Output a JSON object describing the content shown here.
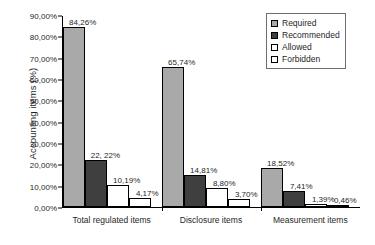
{
  "chart_data": {
    "type": "bar",
    "title": "",
    "xlabel": "",
    "ylabel": "Accounting items (%)",
    "ylim": [
      0,
      90
    ],
    "grid": false,
    "legend_position": "top-right",
    "categories": [
      "Total regulated items",
      "Disclosure items",
      "Measurement items"
    ],
    "ytick_labels": [
      "90,00%",
      "80,00%",
      "70,00%",
      "60,00%",
      "50,00%",
      "40,00%",
      "30,00%",
      "20,00%",
      "10,00%",
      "0,00%"
    ],
    "ytick_values": [
      90,
      80,
      70,
      60,
      50,
      40,
      30,
      20,
      10,
      0
    ],
    "series": [
      {
        "name": "Required",
        "color": "#a9a9a9",
        "values": [
          84.26,
          65.74,
          18.52
        ],
        "labels": [
          "84,26%",
          "65,74%",
          "18,52%"
        ]
      },
      {
        "name": "Recommended",
        "color": "#3f3f3f",
        "values": [
          22.22,
          14.81,
          7.41
        ],
        "labels": [
          "22, 22%",
          "14,81%",
          "7,41%"
        ]
      },
      {
        "name": "Allowed",
        "color": "#ffffff",
        "values": [
          10.19,
          8.8,
          1.39
        ],
        "labels": [
          "10,19%",
          "8,80%",
          "1,39%"
        ]
      },
      {
        "name": "Forbidden",
        "color": "#ffffff",
        "values": [
          4.17,
          3.7,
          0.46
        ],
        "labels": [
          "4,17%",
          "3,70%",
          "0,46%"
        ]
      }
    ]
  }
}
